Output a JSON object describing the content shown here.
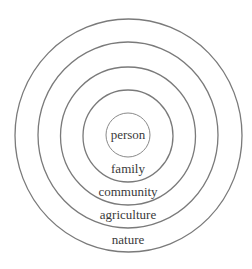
{
  "diagram": {
    "type": "concentric-circles",
    "center": {
      "x": 128,
      "y": 136
    },
    "colors": {
      "stroke": "#7a7a7a",
      "text": "#3a3a3a",
      "background": "#ffffff"
    },
    "rings": [
      {
        "id": "person",
        "label": "person",
        "radius": 22,
        "label_y": 139
      },
      {
        "id": "family",
        "label": "family",
        "radius": 45,
        "label_y": 173
      },
      {
        "id": "community",
        "label": "community",
        "radius": 68,
        "label_y": 196
      },
      {
        "id": "agriculture",
        "label": "agriculture",
        "radius": 92,
        "label_y": 219
      },
      {
        "id": "nature",
        "label": "nature",
        "radius": 115,
        "label_y": 244
      }
    ]
  }
}
